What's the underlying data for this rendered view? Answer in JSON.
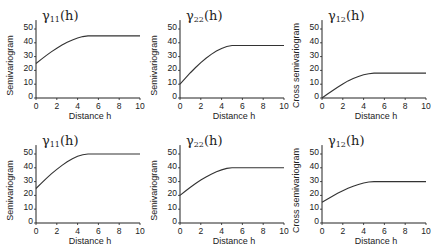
{
  "chart_data": [
    {
      "type": "line",
      "title": "γ11(h)",
      "title_symbol": "γ",
      "title_subscript": "11",
      "title_suffix": "(h)",
      "xlabel": "Distance h",
      "ylabel": "Semivariogram",
      "xlim": [
        0,
        10
      ],
      "ylim": [
        0,
        55
      ],
      "xticks": [
        0,
        2,
        4,
        6,
        8,
        10
      ],
      "yticks": [
        0,
        10,
        20,
        30,
        40,
        50
      ],
      "grid": false,
      "series": [
        {
          "name": "γ11",
          "nugget": 25,
          "sill": 45,
          "range": 5,
          "x": [
            0,
            0.5,
            1,
            1.5,
            2,
            2.5,
            3,
            3.5,
            4,
            4.5,
            5,
            6,
            7,
            8,
            9,
            10
          ],
          "values": [
            25,
            28,
            30.9,
            33.6,
            36.1,
            38.4,
            40.4,
            42.1,
            43.5,
            44.5,
            45,
            45,
            45,
            45,
            45,
            45
          ]
        }
      ]
    },
    {
      "type": "line",
      "title": "γ22(h)",
      "title_symbol": "γ",
      "title_subscript": "22",
      "title_suffix": "(h)",
      "xlabel": "Distance h",
      "ylabel": "Semivariogram",
      "xlim": [
        0,
        10
      ],
      "ylim": [
        0,
        55
      ],
      "xticks": [
        0,
        2,
        4,
        6,
        8,
        10
      ],
      "yticks": [
        0,
        10,
        20,
        30,
        40,
        50
      ],
      "grid": false,
      "series": [
        {
          "name": "γ22",
          "nugget": 10,
          "sill": 38,
          "range": 5,
          "x": [
            0,
            0.5,
            1,
            1.5,
            2,
            2.5,
            3,
            3.5,
            4,
            4.5,
            5,
            6,
            7,
            8,
            9,
            10
          ],
          "values": [
            10,
            14.2,
            18.3,
            22.1,
            25.6,
            28.8,
            31.6,
            34,
            35.9,
            37.3,
            38,
            38,
            38,
            38,
            38,
            38
          ]
        }
      ]
    },
    {
      "type": "line",
      "title": "γ12(h)",
      "title_symbol": "γ",
      "title_subscript": "12",
      "title_suffix": "(h)",
      "xlabel": "Distance h",
      "ylabel": "Cross semivariogram",
      "xlim": [
        0,
        10
      ],
      "ylim": [
        0,
        55
      ],
      "xticks": [
        0,
        2,
        4,
        6,
        8,
        10
      ],
      "yticks": [
        0,
        10,
        20,
        30,
        40,
        50
      ],
      "grid": false,
      "series": [
        {
          "name": "γ12",
          "nugget": 0,
          "sill": 18,
          "range": 5,
          "x": [
            0,
            0.5,
            1,
            1.5,
            2,
            2.5,
            3,
            3.5,
            4,
            4.5,
            5,
            6,
            7,
            8,
            9,
            10
          ],
          "values": [
            0,
            2.7,
            5.3,
            7.8,
            10.1,
            12.4,
            14.1,
            15.6,
            16.8,
            17.6,
            18,
            18,
            18,
            18,
            18,
            18
          ]
        }
      ]
    },
    {
      "type": "line",
      "title": "γ11(h)",
      "title_symbol": "γ",
      "title_subscript": "11",
      "title_suffix": "(h)",
      "xlabel": "Distance h",
      "ylabel": "Semivariogram",
      "xlim": [
        0,
        10
      ],
      "ylim": [
        0,
        55
      ],
      "xticks": [
        0,
        2,
        4,
        6,
        8,
        10
      ],
      "yticks": [
        0,
        10,
        20,
        30,
        40,
        50
      ],
      "grid": false,
      "series": [
        {
          "name": "γ11",
          "nugget": 25,
          "sill": 50,
          "range": 5,
          "x": [
            0,
            0.5,
            1,
            1.5,
            2,
            2.5,
            3,
            3.5,
            4,
            4.5,
            5,
            6,
            7,
            8,
            9,
            10
          ],
          "values": [
            25,
            28.7,
            32.4,
            35.8,
            38.9,
            41.8,
            44.4,
            46.6,
            48.3,
            49.5,
            50,
            50,
            50,
            50,
            50,
            50
          ]
        }
      ]
    },
    {
      "type": "line",
      "title": "γ22(h)",
      "title_symbol": "γ",
      "title_subscript": "22",
      "title_suffix": "(h)",
      "xlabel": "Distance h",
      "ylabel": "Semivariogram",
      "xlim": [
        0,
        10
      ],
      "ylim": [
        0,
        55
      ],
      "xticks": [
        0,
        2,
        4,
        6,
        8,
        10
      ],
      "yticks": [
        0,
        10,
        20,
        30,
        40,
        50
      ],
      "grid": false,
      "series": [
        {
          "name": "γ22",
          "nugget": 20,
          "sill": 40,
          "range": 5,
          "x": [
            0,
            0.5,
            1,
            1.5,
            2,
            2.5,
            3,
            3.5,
            4,
            4.5,
            5,
            6,
            7,
            8,
            9,
            10
          ],
          "values": [
            20,
            23,
            25.9,
            28.6,
            31.1,
            33.4,
            35.4,
            37.1,
            38.5,
            39.6,
            40,
            40,
            40,
            40,
            40,
            40
          ]
        }
      ]
    },
    {
      "type": "line",
      "title": "γ12(h)",
      "title_symbol": "γ",
      "title_subscript": "12",
      "title_suffix": "(h)",
      "xlabel": "Distance h",
      "ylabel": "Cross semivariogram",
      "xlim": [
        0,
        10
      ],
      "ylim": [
        0,
        55
      ],
      "xticks": [
        0,
        2,
        4,
        6,
        8,
        10
      ],
      "yticks": [
        0,
        10,
        20,
        30,
        40,
        50
      ],
      "grid": false,
      "series": [
        {
          "name": "γ12",
          "nugget": 15,
          "sill": 30,
          "range": 5,
          "x": [
            0,
            0.5,
            1,
            1.5,
            2,
            2.5,
            3,
            3.5,
            4,
            4.5,
            5,
            6,
            7,
            8,
            9,
            10
          ],
          "values": [
            15,
            17.2,
            19.4,
            21.5,
            23.4,
            25.1,
            26.6,
            27.9,
            29,
            29.7,
            30,
            30,
            30,
            30,
            30,
            30
          ]
        }
      ]
    }
  ],
  "style": {
    "line_color": "#333333",
    "axis_color": "#222222"
  }
}
